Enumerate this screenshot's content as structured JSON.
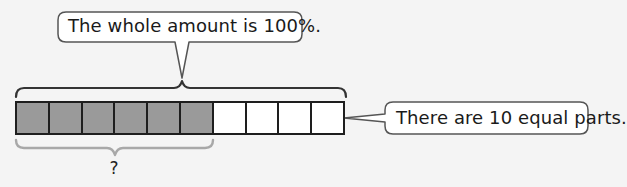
{
  "diagram": {
    "type": "percent-bar-model",
    "top_callout": {
      "text": "The whole amount is 100%."
    },
    "right_callout": {
      "text": "There are 10 equal parts."
    },
    "bar": {
      "total_parts": 10,
      "shaded_parts": 6,
      "cells": [
        {
          "index": 1,
          "state": "shaded"
        },
        {
          "index": 2,
          "state": "shaded"
        },
        {
          "index": 3,
          "state": "shaded"
        },
        {
          "index": 4,
          "state": "shaded"
        },
        {
          "index": 5,
          "state": "shaded"
        },
        {
          "index": 6,
          "state": "shaded"
        },
        {
          "index": 7,
          "state": "unshaded"
        },
        {
          "index": 8,
          "state": "unshaded"
        },
        {
          "index": 9,
          "state": "unshaded"
        },
        {
          "index": 10,
          "state": "unshaded"
        }
      ]
    },
    "bottom_brace": {
      "label": "?"
    },
    "colors": {
      "background": "#f4f4f4",
      "shaded_cell": "#9a9a9a",
      "unshaded_cell": "#ffffff",
      "outline": "#1e1e1e",
      "top_brace": "#333333",
      "bottom_brace": "#a8a8a8",
      "callout_border": "#555555",
      "callout_fill": "#ffffff"
    }
  }
}
